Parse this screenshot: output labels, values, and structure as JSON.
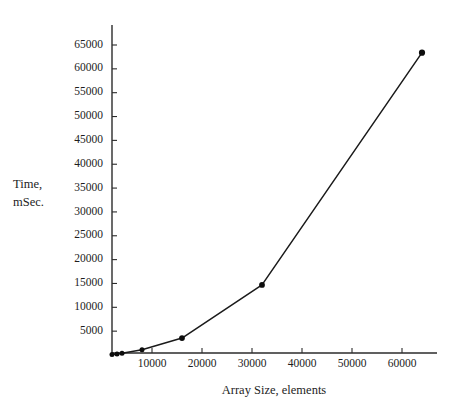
{
  "chart_data": {
    "type": "line",
    "title": "",
    "subtitle": "",
    "xlabel": "Array Size, elements",
    "ylabel_line1": "Time,",
    "ylabel_line2": "mSec.",
    "ylabel": "Time, mSec.",
    "grid": false,
    "legend": false,
    "legend_position": "none",
    "marker": "filled-circle",
    "line_color": "#1a1a1a",
    "marker_color": "#0d0d0d",
    "axis_color": "#2b2b2b",
    "background": "#ffffff",
    "xlim": [
      2000,
      69000
    ],
    "ylim": [
      0,
      67000
    ],
    "xticks": [
      10000,
      20000,
      30000,
      40000,
      50000,
      60000
    ],
    "xtick_labels": [
      "10000",
      "20000",
      "30000",
      "40000",
      "50000",
      "60000"
    ],
    "yticks": [
      5000,
      10000,
      15000,
      20000,
      25000,
      30000,
      35000,
      40000,
      45000,
      50000,
      55000,
      60000,
      65000
    ],
    "ytick_labels": [
      "5000",
      "10000",
      "15000",
      "20000",
      "25000",
      "30000",
      "35000",
      "40000",
      "45000",
      "50000",
      "55000",
      "60000",
      "65000"
    ],
    "series": [
      {
        "name": "",
        "x": [
          2000,
          3000,
          4000,
          8000,
          16000,
          32000,
          64000
        ],
        "values": [
          100,
          200,
          350,
          1100,
          3550,
          14700,
          63400
        ]
      }
    ]
  }
}
